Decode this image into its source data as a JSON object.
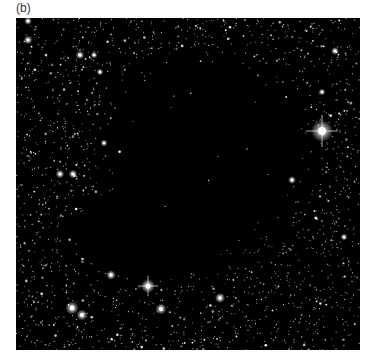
{
  "figure": {
    "panel_label": "(b)",
    "image": {
      "subject": "dark-nebula-star-field",
      "description": "Star field with a dark molecular cloud obscuring background stars in the center",
      "background_color": "#000000",
      "star_color": "#ffffff",
      "bright_stars": [
        {
          "x": 322,
          "y": 131,
          "r": 5,
          "spikes": true
        },
        {
          "x": 148,
          "y": 286,
          "r": 3.2,
          "spikes": true
        },
        {
          "x": 72,
          "y": 308,
          "r": 3,
          "spikes": false
        },
        {
          "x": 82,
          "y": 315,
          "r": 2.5,
          "spikes": false
        },
        {
          "x": 161,
          "y": 309,
          "r": 2.5,
          "spikes": false
        },
        {
          "x": 220,
          "y": 298,
          "r": 2.3,
          "spikes": false
        },
        {
          "x": 111,
          "y": 275,
          "r": 2.2,
          "spikes": false
        },
        {
          "x": 28,
          "y": 21,
          "r": 1.8,
          "spikes": false
        },
        {
          "x": 28,
          "y": 40,
          "r": 2,
          "spikes": false
        },
        {
          "x": 80,
          "y": 55,
          "r": 2,
          "spikes": false
        },
        {
          "x": 60,
          "y": 174,
          "r": 2,
          "spikes": false
        },
        {
          "x": 73,
          "y": 174,
          "r": 2,
          "spikes": false
        },
        {
          "x": 335,
          "y": 51,
          "r": 1.8,
          "spikes": false
        },
        {
          "x": 292,
          "y": 180,
          "r": 1.8,
          "spikes": false
        },
        {
          "x": 94,
          "y": 55,
          "r": 1.6,
          "spikes": false
        },
        {
          "x": 100,
          "y": 72,
          "r": 1.6,
          "spikes": false
        },
        {
          "x": 322,
          "y": 92,
          "r": 1.6,
          "spikes": false
        },
        {
          "x": 344,
          "y": 237,
          "r": 1.6,
          "spikes": false
        },
        {
          "x": 104,
          "y": 143,
          "r": 1.6,
          "spikes": false
        }
      ],
      "dark_cloud": {
        "cx": 180,
        "cy": 170,
        "rx": 115,
        "ry": 110
      }
    }
  }
}
